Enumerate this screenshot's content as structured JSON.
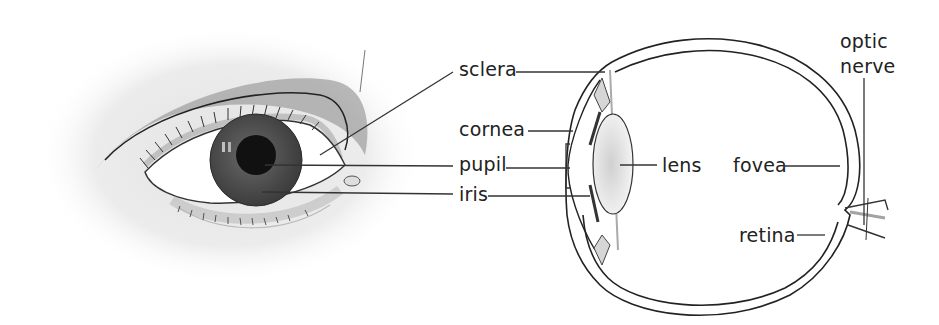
{
  "diagram": {
    "type": "labeled anatomical illustration",
    "left_view": "external view of the human eye",
    "right_view": "cross-section of the human eyeball",
    "labels": {
      "sclera": "sclera",
      "cornea": "cornea",
      "pupil": "pupil",
      "iris": "iris",
      "lens": "lens",
      "fovea": "fovea",
      "retina": "retina",
      "optic_line1": "optic",
      "optic_line2": "nerve"
    },
    "colors": {
      "line": "#333333",
      "iris": "#555555",
      "pupil": "#111111",
      "shadow": "#bbbbbb"
    }
  }
}
